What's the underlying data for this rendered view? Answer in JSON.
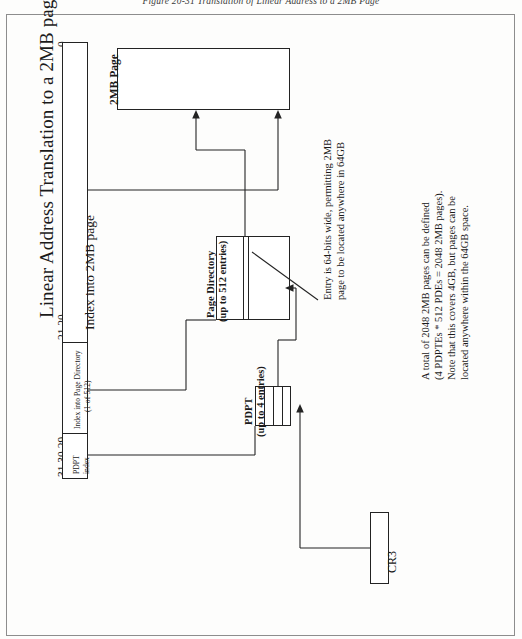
{
  "figure": {
    "caption": "Figure 20-31 Translation of Linear Address to a 2MB Page",
    "title": "Linear Address Translation to a 2MB page"
  },
  "linear_address": {
    "bit_labels": {
      "msb": "31 30 29",
      "mid": "21 20",
      "lsb": "0"
    },
    "fields": [
      {
        "name": "pdpt-index-field",
        "line1": "PDPT",
        "line2": "index"
      },
      {
        "name": "page-directory-index-field",
        "line1": "Index into Page Directory",
        "line2": "(1-of-512)"
      },
      {
        "name": "page-offset-field",
        "line1": "Index into 2MB page",
        "line2": ""
      }
    ]
  },
  "structures": {
    "pdpt": {
      "line1": "PDPT",
      "line2": "(up to 4 entries)"
    },
    "page_directory": {
      "line1": "Page Directory",
      "line2": "(up to 512 entries)"
    },
    "page_2mb": {
      "line1": "2MB Page",
      "line2": ""
    },
    "cr3": {
      "label": "CR3"
    }
  },
  "notes": {
    "entry_note": [
      "Entry is 64-bits wide, permitting 2MB",
      "page to be located anywhere in 64GB"
    ],
    "capacity_note": [
      "A total of 2048 2MB pages can be defined",
      "(4 PDPTEs * 512 PDEs = 2048 2MB pages).",
      "Note that this covers 4GB, but pages can be",
      "located anywhere within the 64GB space."
    ]
  },
  "colors": {
    "ink": "#232323",
    "paper": "#fdfdfc",
    "frame": "#8d8d8d"
  }
}
